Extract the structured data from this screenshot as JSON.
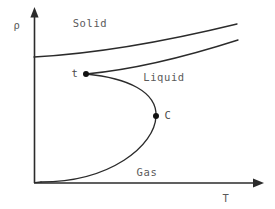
{
  "figure": {
    "background_color": "#ffffff",
    "line_color": "#2b2b2b",
    "label_color": "#5a5a5a"
  },
  "axes": {
    "y": {
      "label": "ρ",
      "label_x": 17,
      "label_y": 26,
      "origin_x": 34,
      "origin_y": 183,
      "tip_y": 8
    },
    "x": {
      "label": "T",
      "label_x": 226,
      "label_y": 199,
      "origin_x": 34,
      "origin_y": 183,
      "tip_x": 263
    }
  },
  "regions": [
    {
      "name": "solid",
      "label": "Solid",
      "x": 90,
      "y": 24
    },
    {
      "name": "liquid",
      "label": "Liquid",
      "x": 164,
      "y": 78
    },
    {
      "name": "gas",
      "label": "Gas",
      "x": 147,
      "y": 173
    }
  ],
  "points": [
    {
      "name": "triple-point",
      "label": "t",
      "dot_x": 86,
      "dot_y": 74,
      "label_x": 75,
      "label_y": 74,
      "radius": 3.0
    },
    {
      "name": "critical-point",
      "label": "C",
      "dot_x": 156,
      "dot_y": 116,
      "label_x": 168,
      "label_y": 116,
      "radius": 3.0
    }
  ],
  "curves": [
    {
      "name": "solid-liquid-upper-boundary",
      "description": "Upper solid branch rising from the rho axis to the right edge",
      "path": "M 34 57 C 90 54, 155 44, 237 24"
    },
    {
      "name": "solid-liquid-lower-boundary",
      "description": "Lower solid-liquid boundary starting at the triple point and rising right",
      "path": "M 86 74 C 130 70, 185 57, 238 40"
    },
    {
      "name": "coexistence-dome-liquid-branch",
      "description": "Liquid branch of the coexistence curve from triple point bulging right to the critical point",
      "path": "M 86 74 C 128 78, 157 92, 156 116"
    },
    {
      "name": "coexistence-dome-gas-branch",
      "description": "Gas branch of the coexistence curve from the critical point sweeping down to the T axis",
      "path": "M 156 116 C 155 146, 110 182, 41 182"
    },
    {
      "name": "gas-axis-tail",
      "description": "Gas branch flattening onto the T axis near the origin",
      "path": "M 41 182 L 35 182.6"
    }
  ],
  "chart_data": {
    "type": "line",
    "title": "",
    "xlabel": "T",
    "ylabel": "ρ",
    "grid": false,
    "legend": "none",
    "annotations": [
      {
        "text": "Solid",
        "role": "region-label"
      },
      {
        "text": "Liquid",
        "role": "region-label"
      },
      {
        "text": "Gas",
        "role": "region-label"
      },
      {
        "text": "t",
        "role": "triple-point-marker"
      },
      {
        "text": "C",
        "role": "critical-point-marker"
      }
    ],
    "series": [
      {
        "name": "solid-liquid-upper-boundary",
        "points": [
          [
            0.0,
            0.72
          ],
          [
            0.32,
            0.74
          ],
          [
            0.69,
            0.79
          ],
          [
            1.16,
            0.91
          ]
        ]
      },
      {
        "name": "solid-liquid-lower-boundary",
        "points": [
          [
            0.3,
            0.62
          ],
          [
            0.55,
            0.65
          ],
          [
            0.9,
            0.72
          ],
          [
            1.17,
            0.82
          ]
        ]
      },
      {
        "name": "coexistence-dome-liquid-branch",
        "points": [
          [
            0.3,
            0.62
          ],
          [
            0.54,
            0.6
          ],
          [
            0.71,
            0.52
          ],
          [
            0.7,
            0.38
          ]
        ]
      },
      {
        "name": "coexistence-dome-gas-branch",
        "points": [
          [
            0.7,
            0.38
          ],
          [
            0.7,
            0.21
          ],
          [
            0.44,
            0.01
          ],
          [
            0.04,
            0.01
          ]
        ]
      }
    ]
  }
}
